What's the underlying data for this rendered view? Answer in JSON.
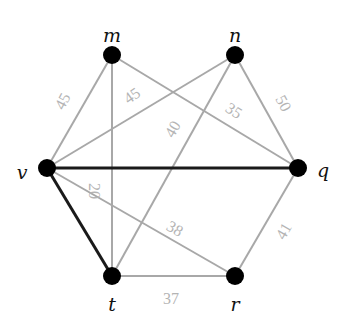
{
  "graph": {
    "nodes": [
      {
        "id": "m",
        "label": "m",
        "x": 112,
        "y": 55,
        "lx": 112,
        "ly": 37
      },
      {
        "id": "n",
        "label": "n",
        "x": 235,
        "y": 55,
        "lx": 235,
        "ly": 37
      },
      {
        "id": "v",
        "label": "v",
        "x": 47,
        "y": 168,
        "lx": 22,
        "ly": 174
      },
      {
        "id": "q",
        "label": "q",
        "x": 298,
        "y": 168,
        "lx": 323,
        "ly": 172
      },
      {
        "id": "t",
        "label": "t",
        "x": 112,
        "y": 276,
        "lx": 112,
        "ly": 306
      },
      {
        "id": "r",
        "label": "r",
        "x": 235,
        "y": 276,
        "lx": 235,
        "ly": 306
      }
    ],
    "edges": [
      {
        "from": "v",
        "to": "m",
        "weight": "45",
        "style": "gray",
        "lx": 64,
        "ly": 102,
        "rot": -62
      },
      {
        "from": "v",
        "to": "n",
        "weight": "45",
        "style": "gray",
        "lx": 133,
        "ly": 97,
        "rot": -35
      },
      {
        "from": "m",
        "to": "q",
        "weight": "35",
        "style": "gray",
        "lx": 233,
        "ly": 112,
        "rot": 33
      },
      {
        "from": "n",
        "to": "q",
        "weight": "50",
        "style": "gray",
        "lx": 282,
        "ly": 104,
        "rot": 62
      },
      {
        "from": "m",
        "to": "t",
        "weight": "20",
        "style": "gray",
        "lx": 93,
        "ly": 191,
        "rot": 90
      },
      {
        "from": "n",
        "to": "t",
        "weight": "40",
        "style": "gray",
        "lx": 174,
        "ly": 130,
        "rot": -60
      },
      {
        "from": "v",
        "to": "q",
        "weight": "",
        "style": "black"
      },
      {
        "from": "v",
        "to": "t",
        "weight": "",
        "style": "black"
      },
      {
        "from": "v",
        "to": "r",
        "weight": "38",
        "style": "gray",
        "lx": 174,
        "ly": 230,
        "rot": 30
      },
      {
        "from": "t",
        "to": "r",
        "weight": "37",
        "style": "gray",
        "lx": 171,
        "ly": 300,
        "rot": 0
      },
      {
        "from": "q",
        "to": "r",
        "weight": "41",
        "style": "gray",
        "lx": 285,
        "ly": 232,
        "rot": -60
      }
    ]
  },
  "colors": {
    "light_edge": "#a8a8a8",
    "highlight_edge": "#1a1a1a",
    "node_fill": "#000000",
    "weight_text": "#b4b4b4"
  }
}
